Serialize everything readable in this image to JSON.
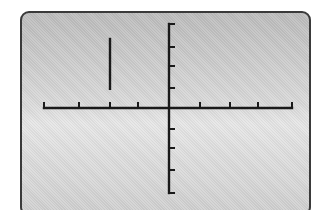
{
  "display": {
    "type": "graphing-calculator-screen",
    "background_color": "#d4d4d4",
    "border_color": "#3a3a3a",
    "ink_color": "#1a1a1a"
  },
  "chart_data": {
    "type": "line",
    "title": "",
    "xlabel": "",
    "ylabel": "",
    "xlim": [
      -4,
      4
    ],
    "ylim": [
      -4,
      4
    ],
    "x_tick_step": 1,
    "y_tick_step": 1,
    "grid": false,
    "legend": null,
    "series": [
      {
        "name": "x = -2",
        "kind": "vertical-segment",
        "x": [
          -2,
          -2
        ],
        "y": [
          0.9,
          3.4
        ]
      }
    ]
  }
}
